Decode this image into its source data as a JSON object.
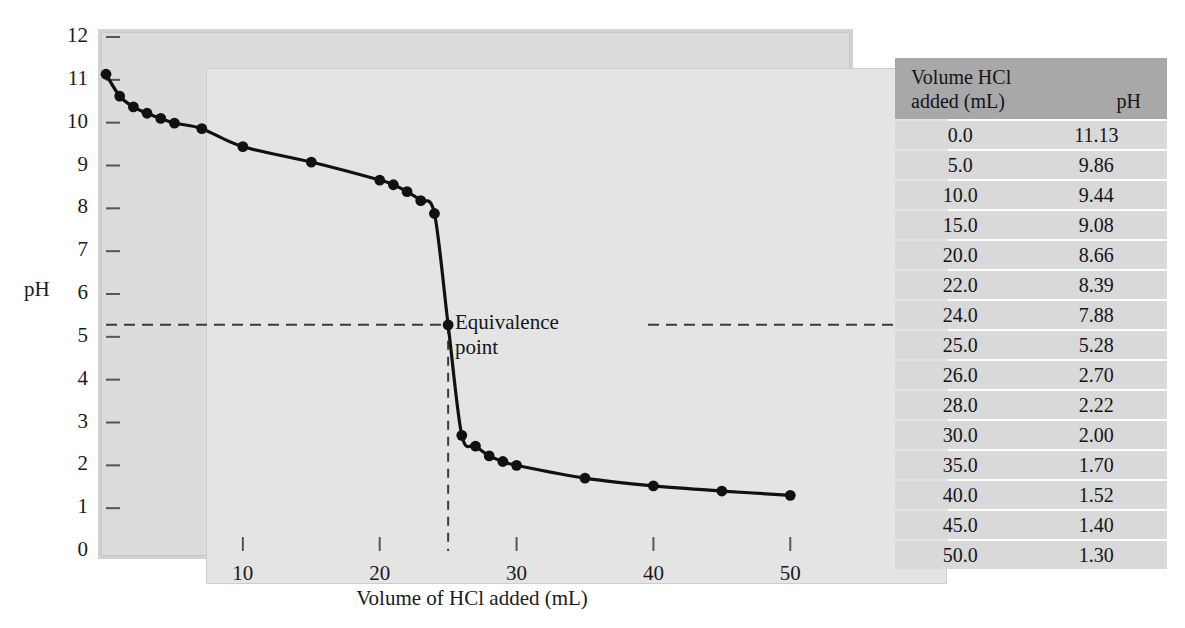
{
  "chart_data": {
    "type": "line",
    "title": "",
    "xlabel": "Volume of HCl added (mL)",
    "ylabel": "pH",
    "xlim": [
      0,
      54
    ],
    "ylim": [
      0,
      12
    ],
    "grid": false,
    "legend": "none",
    "x_ticks": [
      10,
      20,
      30,
      40,
      50
    ],
    "y_ticks": [
      0,
      1,
      2,
      3,
      4,
      5,
      6,
      7,
      8,
      9,
      10,
      11,
      12
    ],
    "series": [
      {
        "name": "Titration of base with HCl",
        "x": [
          0.0,
          1.0,
          2.0,
          3.0,
          4.0,
          5.0,
          7.0,
          10.0,
          15.0,
          20.0,
          21.0,
          22.0,
          23.0,
          24.0,
          25.0,
          26.0,
          27.0,
          28.0,
          29.0,
          30.0,
          35.0,
          40.0,
          45.0,
          50.0
        ],
        "y": [
          11.13,
          10.62,
          10.37,
          10.22,
          10.1,
          9.99,
          9.86,
          9.44,
          9.08,
          8.66,
          8.55,
          8.39,
          8.18,
          7.88,
          5.28,
          2.7,
          2.45,
          2.22,
          2.09,
          2.0,
          1.7,
          1.52,
          1.4,
          1.3
        ]
      }
    ],
    "annotations": [
      {
        "label": "Equivalence point",
        "x": 25.0,
        "y": 5.28
      }
    ]
  },
  "axes": {
    "y_title": "pH",
    "x_title": "Volume of HCl added (mL)",
    "y_tick_labels": [
      "12",
      "11",
      "10",
      "9",
      "8",
      "7",
      "6",
      "5",
      "4",
      "3",
      "2",
      "1",
      "0"
    ],
    "x_tick_labels": [
      "10",
      "20",
      "30",
      "40",
      "50"
    ]
  },
  "annotation": {
    "line1": "Equivalence",
    "line2": "point"
  },
  "table": {
    "header": {
      "volume": "Volume HCl",
      "volume_units": "added (mL)",
      "ph": "pH"
    },
    "rows": [
      {
        "volume": "0.0",
        "ph": "11.13"
      },
      {
        "volume": "5.0",
        "ph": "9.86"
      },
      {
        "volume": "10.0",
        "ph": "9.44"
      },
      {
        "volume": "15.0",
        "ph": "9.08"
      },
      {
        "volume": "20.0",
        "ph": "8.66"
      },
      {
        "volume": "22.0",
        "ph": "8.39"
      },
      {
        "volume": "24.0",
        "ph": "7.88"
      },
      {
        "volume": "25.0",
        "ph": "5.28"
      },
      {
        "volume": "26.0",
        "ph": "2.70"
      },
      {
        "volume": "28.0",
        "ph": "2.22"
      },
      {
        "volume": "30.0",
        "ph": "2.00"
      },
      {
        "volume": "35.0",
        "ph": "1.70"
      },
      {
        "volume": "40.0",
        "ph": "1.52"
      },
      {
        "volume": "45.0",
        "ph": "1.40"
      },
      {
        "volume": "50.0",
        "ph": "1.30"
      }
    ]
  },
  "colors": {
    "curve": "#111111",
    "plot_background": "#e4e4e4",
    "frame": "#d2d2d2",
    "table_header": "#a8a8a8",
    "table_row": "#d9d9d9"
  }
}
